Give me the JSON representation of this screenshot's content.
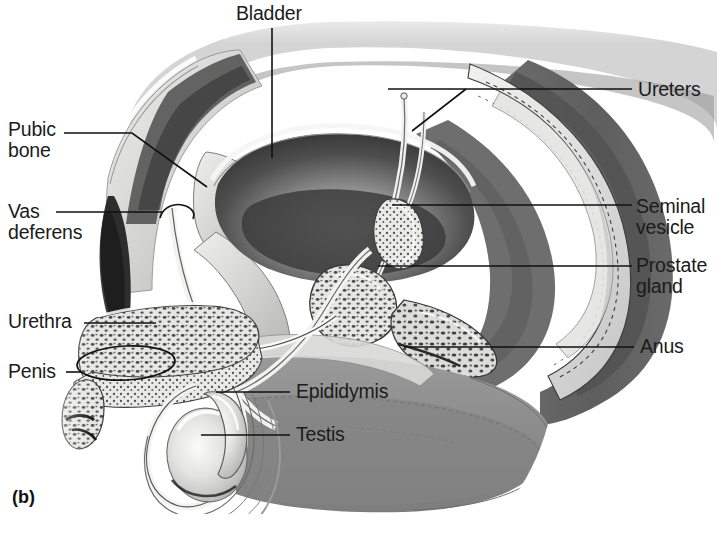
{
  "figure": {
    "caption": "(b)",
    "background_color": "#ffffff",
    "ink_color": "#1b1b1b",
    "leader_line_color": "#111111"
  },
  "labels": {
    "bladder": "Bladder",
    "ureters": "Ureters",
    "pubic_bone": "Pubic\nbone",
    "vas_deferens": "Vas\ndeferens",
    "seminal_vesicle": "Seminal\nvesicle",
    "prostate_gland": "Prostate\ngland",
    "urethra": "Urethra",
    "anus": "Anus",
    "penis": "Penis",
    "epididymis": "Epididymis",
    "testis": "Testis"
  },
  "label_list": [
    {
      "id": "bladder",
      "text": "Bladder",
      "side": "top",
      "x": 236,
      "y": 3
    },
    {
      "id": "ureters",
      "text": "Ureters",
      "side": "right",
      "x": 638,
      "y": 79
    },
    {
      "id": "pubic-bone",
      "text": "Pubic bone",
      "side": "left",
      "x": 8,
      "y": 119
    },
    {
      "id": "vas-deferens",
      "text": "Vas deferens",
      "side": "left",
      "x": 8,
      "y": 201
    },
    {
      "id": "seminal-vesicle",
      "text": "Seminal vesicle",
      "side": "right",
      "x": 636,
      "y": 196
    },
    {
      "id": "prostate-gland",
      "text": "Prostate gland",
      "side": "right",
      "x": 636,
      "y": 255
    },
    {
      "id": "urethra",
      "text": "Urethra",
      "side": "left",
      "x": 8,
      "y": 311
    },
    {
      "id": "anus",
      "text": "Anus",
      "side": "right",
      "x": 640,
      "y": 336
    },
    {
      "id": "penis",
      "text": "Penis",
      "side": "left",
      "x": 8,
      "y": 361
    },
    {
      "id": "epididymis",
      "text": "Epididymis",
      "side": "inner",
      "x": 296,
      "y": 381
    },
    {
      "id": "testis",
      "text": "Testis",
      "side": "inner",
      "x": 296,
      "y": 424
    }
  ]
}
